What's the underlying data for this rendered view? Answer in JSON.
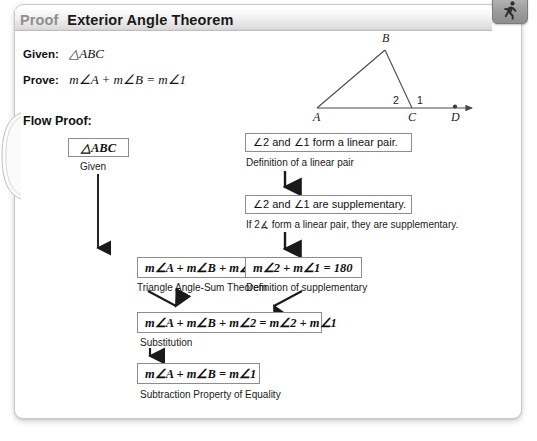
{
  "header": {
    "kicker": "Proof",
    "title": "Exterior Angle Theorem"
  },
  "runner_tab": {
    "icon": "running-person-icon"
  },
  "page_curl": {
    "icon": "page-curl-icon"
  },
  "given": {
    "label": "Given:",
    "value": "△ABC"
  },
  "prove": {
    "label": "Prove:",
    "value": "m∠A + m∠B = m∠1"
  },
  "flow_proof_label": "Flow Proof:",
  "diagram": {
    "type": "triangle-with-exterior-angle",
    "vertices": {
      "A": {
        "label": "A",
        "x": 17,
        "y": 84
      },
      "B": {
        "label": "B",
        "x": 85,
        "y": 23
      },
      "C": {
        "label": "C",
        "x": 112,
        "y": 84
      },
      "D": {
        "label": "D",
        "x": 155,
        "y": 84
      }
    },
    "angles": [
      {
        "label": "2",
        "x": 97,
        "y": 76
      },
      {
        "label": "1",
        "x": 121,
        "y": 76
      }
    ],
    "ray_end_x": 178,
    "baseline_y": 84
  },
  "flow": {
    "boxes": [
      {
        "id": "abc",
        "text": "△ABC",
        "reason": "Given"
      },
      {
        "id": "tas",
        "text": "m∠A + m∠B + m∠2 = 180",
        "reason": "Triangle Angle-Sum Theorem"
      },
      {
        "id": "lp",
        "text": "∠2 and ∠1 form a linear pair.",
        "reason": "Definition of a linear pair"
      },
      {
        "id": "supp",
        "text": "∠2 and ∠1 are supplementary.",
        "reason": "If 2∡ form a linear pair, they are supplementary."
      },
      {
        "id": "defsupp",
        "text": "m∠2 + m∠1 = 180",
        "reason": "Definition of supplementary"
      },
      {
        "id": "subst",
        "text": "m∠A + m∠B + m∠2 = m∠2 + m∠1",
        "reason": "Substitution"
      },
      {
        "id": "final",
        "text": "m∠A + m∠B = m∠1",
        "reason": "Subtraction Property of Equality"
      }
    ]
  },
  "colors": {
    "box_border": "#8d8d8d",
    "header_kicker": "#8e8e8e",
    "header_title": "#1a1a1a",
    "arrow": "#1a1a1a",
    "card_border": "#c9c9c9"
  }
}
